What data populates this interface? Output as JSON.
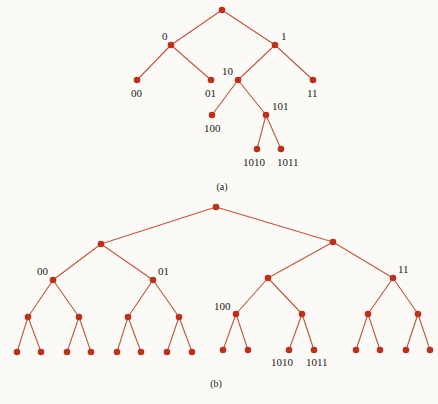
{
  "colors": {
    "edge": "#c0553f",
    "node": "#b8321d",
    "text": "#222222",
    "background": "#fbfaf6"
  },
  "diagrams": [
    {
      "id": "a",
      "caption": "(a)",
      "caption_pos": [
        222,
        190
      ],
      "nodes": [
        {
          "id": "r",
          "x": 222,
          "y": 10,
          "label": ""
        },
        {
          "id": "0",
          "x": 171,
          "y": 45,
          "label": "0",
          "lx": 162,
          "ly": 40
        },
        {
          "id": "1",
          "x": 275,
          "y": 45,
          "label": "1",
          "lx": 281,
          "ly": 40
        },
        {
          "id": "00",
          "x": 137,
          "y": 80,
          "label": "00",
          "lx": 131,
          "ly": 97
        },
        {
          "id": "01",
          "x": 211,
          "y": 80,
          "label": "01",
          "lx": 205,
          "ly": 97
        },
        {
          "id": "10",
          "x": 238,
          "y": 80,
          "label": "10",
          "lx": 222,
          "ly": 75
        },
        {
          "id": "11",
          "x": 313,
          "y": 80,
          "label": "11",
          "lx": 307,
          "ly": 97
        },
        {
          "id": "100",
          "x": 212,
          "y": 115,
          "label": "100",
          "lx": 204,
          "ly": 132
        },
        {
          "id": "101",
          "x": 266,
          "y": 115,
          "label": "101",
          "lx": 272,
          "ly": 110
        },
        {
          "id": "1010",
          "x": 257,
          "y": 149,
          "label": "1010",
          "lx": 243,
          "ly": 166
        },
        {
          "id": "1011",
          "x": 281,
          "y": 149,
          "label": "1011",
          "lx": 277,
          "ly": 166
        }
      ],
      "edges": [
        [
          "r",
          "0"
        ],
        [
          "r",
          "1"
        ],
        [
          "0",
          "00"
        ],
        [
          "0",
          "01"
        ],
        [
          "1",
          "10"
        ],
        [
          "1",
          "11"
        ],
        [
          "10",
          "100"
        ],
        [
          "10",
          "101"
        ],
        [
          "101",
          "1010"
        ],
        [
          "101",
          "1011"
        ]
      ]
    },
    {
      "id": "b",
      "caption": "(b)",
      "caption_pos": [
        216,
        387
      ],
      "nodes": [
        {
          "id": "r",
          "x": 216,
          "y": 207,
          "label": ""
        },
        {
          "id": "0",
          "x": 101,
          "y": 244,
          "label": ""
        },
        {
          "id": "1",
          "x": 333,
          "y": 242,
          "label": ""
        },
        {
          "id": "00",
          "x": 53,
          "y": 280,
          "label": "00",
          "lx": 37,
          "ly": 275
        },
        {
          "id": "01",
          "x": 153,
          "y": 280,
          "label": "01",
          "lx": 158,
          "ly": 275
        },
        {
          "id": "10",
          "x": 268,
          "y": 278,
          "label": ""
        },
        {
          "id": "11",
          "x": 393,
          "y": 278,
          "label": "11",
          "lx": 398,
          "ly": 273
        },
        {
          "id": "000",
          "x": 28,
          "y": 317,
          "label": ""
        },
        {
          "id": "001",
          "x": 79,
          "y": 317,
          "label": ""
        },
        {
          "id": "010",
          "x": 128,
          "y": 317,
          "label": ""
        },
        {
          "id": "011",
          "x": 179,
          "y": 317,
          "label": ""
        },
        {
          "id": "100",
          "x": 236,
          "y": 314,
          "label": "100",
          "lx": 214,
          "ly": 310
        },
        {
          "id": "101",
          "x": 302,
          "y": 314,
          "label": ""
        },
        {
          "id": "110",
          "x": 368,
          "y": 314,
          "label": ""
        },
        {
          "id": "111",
          "x": 418,
          "y": 314,
          "label": ""
        },
        {
          "id": "0000",
          "x": 17,
          "y": 352,
          "label": ""
        },
        {
          "id": "0001",
          "x": 41,
          "y": 352,
          "label": ""
        },
        {
          "id": "0010",
          "x": 67,
          "y": 352,
          "label": ""
        },
        {
          "id": "0011",
          "x": 91,
          "y": 352,
          "label": ""
        },
        {
          "id": "0100",
          "x": 117,
          "y": 352,
          "label": ""
        },
        {
          "id": "0101",
          "x": 141,
          "y": 352,
          "label": ""
        },
        {
          "id": "0110",
          "x": 167,
          "y": 352,
          "label": ""
        },
        {
          "id": "0111",
          "x": 192,
          "y": 352,
          "label": ""
        },
        {
          "id": "1000",
          "x": 223,
          "y": 350,
          "label": ""
        },
        {
          "id": "1001",
          "x": 248,
          "y": 350,
          "label": ""
        },
        {
          "id": "1010",
          "x": 289,
          "y": 350,
          "label": "1010",
          "lx": 271,
          "ly": 366
        },
        {
          "id": "1011",
          "x": 314,
          "y": 350,
          "label": "1011",
          "lx": 306,
          "ly": 366
        },
        {
          "id": "1100",
          "x": 356,
          "y": 350,
          "label": ""
        },
        {
          "id": "1101",
          "x": 380,
          "y": 350,
          "label": ""
        },
        {
          "id": "1110",
          "x": 406,
          "y": 350,
          "label": ""
        },
        {
          "id": "1111",
          "x": 430,
          "y": 350,
          "label": ""
        }
      ],
      "edges": [
        [
          "r",
          "0"
        ],
        [
          "r",
          "1"
        ],
        [
          "0",
          "00"
        ],
        [
          "0",
          "01"
        ],
        [
          "1",
          "10"
        ],
        [
          "1",
          "11"
        ],
        [
          "00",
          "000"
        ],
        [
          "00",
          "001"
        ],
        [
          "01",
          "010"
        ],
        [
          "01",
          "011"
        ],
        [
          "10",
          "100"
        ],
        [
          "10",
          "101"
        ],
        [
          "11",
          "110"
        ],
        [
          "11",
          "111"
        ],
        [
          "000",
          "0000"
        ],
        [
          "000",
          "0001"
        ],
        [
          "001",
          "0010"
        ],
        [
          "001",
          "0011"
        ],
        [
          "010",
          "0100"
        ],
        [
          "010",
          "0101"
        ],
        [
          "011",
          "0110"
        ],
        [
          "011",
          "0111"
        ],
        [
          "100",
          "1000"
        ],
        [
          "100",
          "1001"
        ],
        [
          "101",
          "1010"
        ],
        [
          "101",
          "1011"
        ],
        [
          "110",
          "1100"
        ],
        [
          "110",
          "1101"
        ],
        [
          "111",
          "1110"
        ],
        [
          "111",
          "1111"
        ]
      ]
    }
  ]
}
